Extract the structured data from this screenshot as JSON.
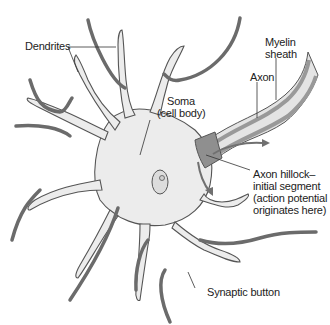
{
  "diagram": {
    "colors": {
      "cell_fill": "#ececec",
      "cell_outline": "#555555",
      "presynaptic_axon": "#6b6b6b",
      "axon_hillock": "#8f8f8f",
      "myelin": "#d8d8d8",
      "arrow": "#707070"
    },
    "labels": {
      "dendrites": "Dendrites",
      "soma_line1": "Soma",
      "soma_line2": "(cell body)",
      "myelin_line1": "Myelin",
      "myelin_line2": "sheath",
      "axon": "Axon",
      "hillock_line1": "Axon hillock–",
      "hillock_line2": "initial segment",
      "hillock_line3": "(action potential",
      "hillock_line4": "originates here)",
      "synaptic_button": "Synaptic button"
    }
  }
}
